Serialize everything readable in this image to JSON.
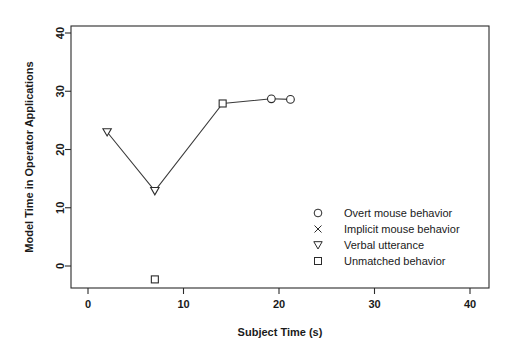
{
  "chart_data": {
    "type": "line",
    "title": "",
    "xlabel": "Subject Time (s)",
    "ylabel": "Model Time in Operator Applications",
    "xlim": [
      0,
      42
    ],
    "ylim": [
      -4,
      42
    ],
    "xticks": [
      0,
      10,
      20,
      30,
      40
    ],
    "xtick_labels": [
      "0",
      "10",
      "20",
      "30",
      "40"
    ],
    "yticks": [
      0,
      10,
      20,
      30,
      40
    ],
    "ytick_labels": [
      "0",
      "10",
      "20",
      "30",
      "40"
    ],
    "grid": false,
    "legend_position": "lower right",
    "series": [
      {
        "name": "Main trajectory",
        "connected": true,
        "points": [
          {
            "x": 2.0,
            "y": 23.0,
            "marker": "triangle-down",
            "category": "Verbal utterance"
          },
          {
            "x": 7.0,
            "y": 12.9,
            "marker": "triangle-down",
            "category": "Verbal utterance"
          },
          {
            "x": 14.1,
            "y": 27.9,
            "marker": "square",
            "category": "Unmatched behavior"
          },
          {
            "x": 19.2,
            "y": 28.7,
            "marker": "circle",
            "category": "Overt mouse behavior"
          },
          {
            "x": 21.2,
            "y": 28.6,
            "marker": "circle",
            "category": "Overt mouse behavior"
          }
        ]
      },
      {
        "name": "Outlier marker",
        "connected": false,
        "points": [
          {
            "x": 7.0,
            "y": -2.3,
            "marker": "square",
            "category": "Unmatched behavior"
          }
        ]
      }
    ],
    "legend": [
      {
        "marker": "circle",
        "label": "Overt mouse behavior"
      },
      {
        "marker": "cross",
        "label": "Implicit mouse behavior"
      },
      {
        "marker": "triangle-down",
        "label": "Verbal utterance"
      },
      {
        "marker": "square",
        "label": "Unmatched behavior"
      }
    ]
  },
  "colors": {
    "axis": "#2b2b2b",
    "line": "#3a3a3a",
    "marker_fill": "#ffffff",
    "text": "#1a1a1a",
    "background": "#ffffff"
  }
}
